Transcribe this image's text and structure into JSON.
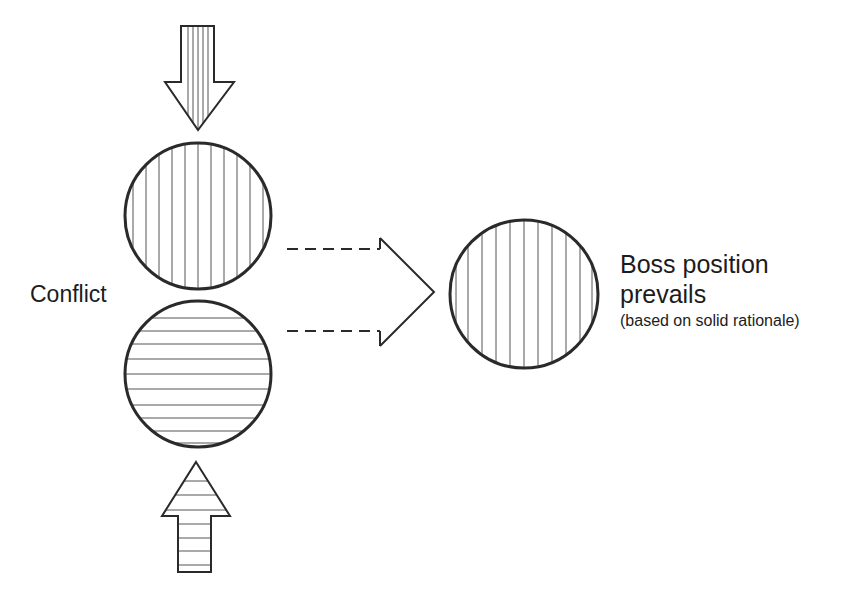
{
  "diagram": {
    "labels": {
      "conflict": "Conflict",
      "outcome_line1": "Boss position",
      "outcome_line2": "prevails",
      "outcome_note": "(based on solid rationale)"
    },
    "shapes": {
      "top_arrow": {
        "direction": "down",
        "fill": "vertical-hatch"
      },
      "top_circle": {
        "fill": "vertical-hatch",
        "represents": "boss position"
      },
      "bottom_circle": {
        "fill": "horizontal-hatch",
        "represents": "other position"
      },
      "bottom_arrow": {
        "direction": "up",
        "fill": "horizontal-hatch"
      },
      "connector": {
        "style": "dashed-outline arrow",
        "direction": "right"
      },
      "result_circle": {
        "fill": "vertical-hatch",
        "represents": "boss position prevails"
      }
    },
    "colors": {
      "stroke": "#2a2a2a",
      "hatch": "#555555",
      "text": "#1c1c1c",
      "background": "#ffffff"
    }
  }
}
